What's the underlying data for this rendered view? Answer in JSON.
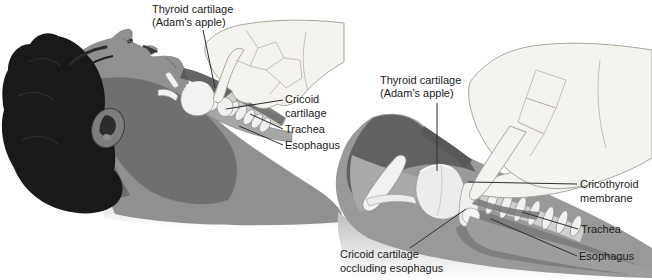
{
  "panels": [
    {
      "name": "patient-overview",
      "labels": {
        "thyroid_l1": "Thyroid cartilage",
        "thyroid_l2": "(Adam's apple)",
        "cricoid_l1": "Cricoid",
        "cricoid_l2": "cartilage",
        "trachea": "Trachea",
        "esophagus": "Esophagus"
      }
    },
    {
      "name": "larynx-closeup",
      "labels": {
        "thyroid_l1": "Thyroid cartilage",
        "thyroid_l2": "(Adam's apple)",
        "cricothyroid_l1": "Cricothyroid",
        "cricothyroid_l2": "membrane",
        "trachea": "Trachea",
        "esophagus": "Esophagus",
        "occlusion_l1": "Cricoid cartilage",
        "occlusion_l2": "occluding esophagus"
      }
    }
  ],
  "colors": {
    "background": "#ffffff",
    "hair": "#191919",
    "skin": "#909090",
    "skin_shadow": "#5f5f5f",
    "hand": "#f4f3ef",
    "cartilage": "#f2f2f0",
    "esophagus_band": "#9d9d9b",
    "label_text": "#1b1b1b",
    "leader_line": "#2e2e2e"
  }
}
